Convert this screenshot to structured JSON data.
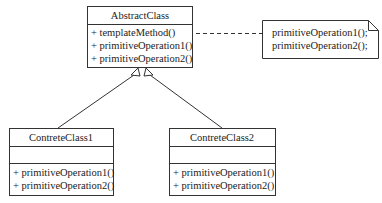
{
  "diagram": {
    "type": "UML class diagram (Template Method pattern)",
    "abstract_class": {
      "name": "AbstractClass",
      "operations": [
        "+ templateMethod()",
        "+ primitiveOperation1()",
        "+ primitiveOperation2()"
      ]
    },
    "note": {
      "lines": [
        "primitiveOperation1();",
        "primitiveOperation2();"
      ]
    },
    "concrete_classes": [
      {
        "name": "ContreteClass1",
        "attributes": [],
        "operations": [
          "+ primitiveOperation1()",
          "+ primitiveOperation2()"
        ]
      },
      {
        "name": "ContreteClass2",
        "attributes": [],
        "operations": [
          "+ primitiveOperation1()",
          "+ primitiveOperation2()"
        ]
      }
    ],
    "relations": [
      {
        "from": "ContreteClass1",
        "to": "AbstractClass",
        "kind": "generalization"
      },
      {
        "from": "ContreteClass2",
        "to": "AbstractClass",
        "kind": "generalization"
      },
      {
        "from": "AbstractClass.templateMethod",
        "to": "note",
        "kind": "note-anchor (dashed)"
      }
    ],
    "colors": {
      "stroke": "#333333",
      "background": "#ffffff",
      "text": "#222222"
    }
  }
}
